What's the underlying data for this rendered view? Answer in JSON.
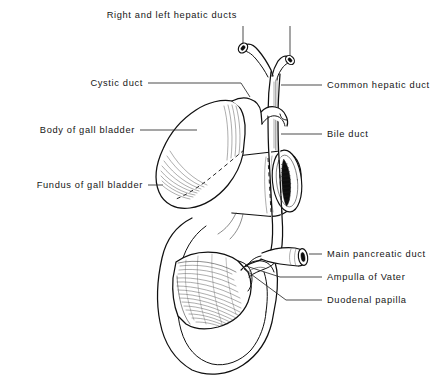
{
  "figure": {
    "style": "pen-and-ink line drawing, black on white",
    "background_color": "#ffffff",
    "ink_color": "#101010",
    "leader_color": "#2a2a2a"
  },
  "labels": {
    "hepatic_ducts": {
      "text": "Right and left hepatic ducts",
      "side": "top",
      "x": 237,
      "y": 18
    },
    "cystic_duct": {
      "text": "Cystic duct",
      "side": "left",
      "x": 143,
      "y": 86
    },
    "common_hepatic": {
      "text": "Common hepatic duct",
      "side": "right",
      "x": 327,
      "y": 88
    },
    "body_gallbladder": {
      "text": "Body of gall bladder",
      "side": "left",
      "x": 135,
      "y": 133
    },
    "bile_duct": {
      "text": "Bile duct",
      "side": "right",
      "x": 327,
      "y": 137
    },
    "fundus_gallbladder": {
      "text": "Fundus of gall bladder",
      "side": "left",
      "x": 143,
      "y": 188
    },
    "main_pancreatic": {
      "text": "Main pancreatic duct",
      "side": "right",
      "x": 327,
      "y": 257
    },
    "ampulla_vater": {
      "text": "Ampulla of Vater",
      "side": "right",
      "x": 327,
      "y": 280
    },
    "duodenal_papilla": {
      "text": "Duodenal papilla",
      "side": "right",
      "x": 327,
      "y": 303
    }
  },
  "structures": [
    {
      "name": "right-hepatic-duct",
      "description": "cut tubular stump, upper left of Y confluence"
    },
    {
      "name": "left-hepatic-duct",
      "description": "cut tubular stump, upper right of Y confluence"
    },
    {
      "name": "common-hepatic-duct",
      "description": "vertical duct below the Y confluence"
    },
    {
      "name": "cystic-duct",
      "description": "duct from gall bladder neck to common hepatic duct"
    },
    {
      "name": "bile-duct",
      "description": "continuation below cystic duct junction, passing behind duodenum"
    },
    {
      "name": "gall-bladder",
      "description": "pear-shaped sac, body and fundus, lying left"
    },
    {
      "name": "duodenum",
      "description": "C-shaped bowel, cut transversely at right, opened anteriorly below"
    },
    {
      "name": "duodenal-mucosa",
      "description": "hatched plicae circulares inside the opened duodenum"
    },
    {
      "name": "main-pancreatic-duct",
      "description": "short cut duct entering from the right"
    },
    {
      "name": "ampulla-of-vater",
      "description": "confluence of bile and pancreatic ducts in duodenal wall"
    },
    {
      "name": "duodenal-papilla",
      "description": "mucosal elevation where the ampulla opens"
    }
  ]
}
